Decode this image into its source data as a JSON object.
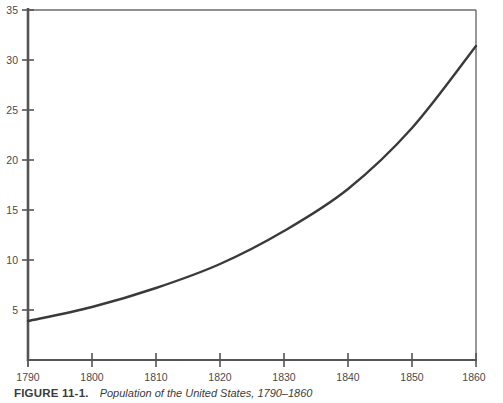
{
  "caption": {
    "figure_number": "FIGURE 11-1.",
    "title": "Population of the United States, 1790–1860"
  },
  "style": {
    "line_color": "#3a3a3a",
    "axis_color": "#555555",
    "frame_color": "#6b6b6b",
    "background": "#ffffff",
    "tick_label_color": "#4a4a4a"
  },
  "chart_data": {
    "type": "line",
    "title": "Population of the United States, 1790–1860",
    "xlabel": "",
    "ylabel": "",
    "x": [
      1790,
      1800,
      1810,
      1820,
      1830,
      1840,
      1850,
      1860
    ],
    "values": [
      3.9,
      5.3,
      7.2,
      9.6,
      12.9,
      17.1,
      23.2,
      31.4
    ],
    "series": [
      {
        "name": "Population (millions)",
        "values": [
          3.9,
          5.3,
          7.2,
          9.6,
          12.9,
          17.1,
          23.2,
          31.4
        ]
      }
    ],
    "xlim": [
      1790,
      1860
    ],
    "ylim": [
      0,
      35
    ],
    "x_ticks": [
      1790,
      1800,
      1810,
      1820,
      1830,
      1840,
      1850,
      1860
    ],
    "x_tick_labels": [
      "1790",
      "1800",
      "1810",
      "1820",
      "1830",
      "1840",
      "1850",
      "1860"
    ],
    "y_ticks": [
      5,
      10,
      15,
      20,
      25,
      30,
      35
    ],
    "y_tick_labels": [
      "5",
      "10",
      "15",
      "20",
      "25",
      "30",
      "35"
    ],
    "grid": false,
    "legend": false,
    "legend_position": "none"
  }
}
